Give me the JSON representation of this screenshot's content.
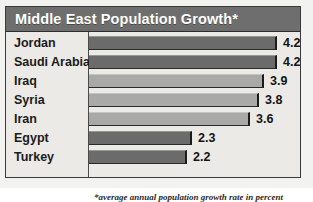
{
  "chart_data": {
    "type": "bar",
    "orientation": "horizontal",
    "title": "Middle East Population Growth*",
    "xlabel": "",
    "ylabel": "",
    "xlim": [
      0,
      4.2
    ],
    "grid": false,
    "legend": null,
    "categories": [
      "Jordan",
      "Saudi Arabia",
      "Iraq",
      "Syria",
      "Iran",
      "Egypt",
      "Turkey"
    ],
    "values": [
      4.2,
      4.2,
      3.9,
      3.8,
      3.6,
      2.3,
      2.2
    ],
    "value_labels": [
      "4.2",
      "4.2",
      "3.9",
      "3.8",
      "3.6",
      "2.3",
      "2.2"
    ],
    "bar_shades": [
      "dark",
      "dark",
      "light",
      "light",
      "light",
      "dark",
      "dark"
    ],
    "annotation": "*average annual population growth rate in percent"
  },
  "colors": {
    "header_bg": "#6e6e6e",
    "header_text": "#ffffff",
    "panel_bg": "#eceae7",
    "bar_dark": "#6b6b6b",
    "bar_light": "#a9a9a7",
    "frame": "#3a3a3a",
    "text": "#1b1b1b"
  }
}
